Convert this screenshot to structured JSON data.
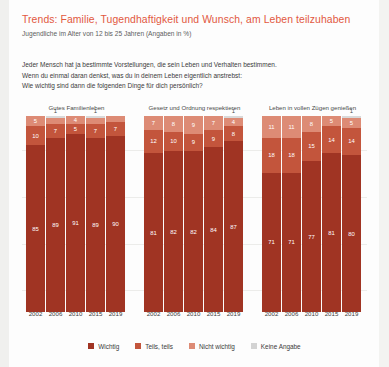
{
  "header": {
    "title": "Trends: Familie, Tugendhaftigkeit und Wunsch, am Leben teilzuhaben",
    "subtitle": "Jugendliche im Alter von 12 bis 25 Jahren (Angaben in %)",
    "title_color": "#e2583f"
  },
  "question": {
    "line1": "Jeder Mensch hat ja bestimmte Vorstellungen, die sein Leben und Verhalten bestimmen.",
    "line2": "Wenn du einmal daran denkst, was du in deinem Leben eigentlich anstrebst:",
    "line3": "Wie wichtig sind dann die folgenden Dinge für dich persönlich?"
  },
  "legend": {
    "items": [
      {
        "label": "Wichtig",
        "color": "#a03423"
      },
      {
        "label": "Teils, teils",
        "color": "#c3553c"
      },
      {
        "label": "Nicht wichtig",
        "color": "#dd8b75"
      },
      {
        "label": "Keine Angabe",
        "color": "#d3d3d3"
      }
    ]
  },
  "chart_data": {
    "type": "bar",
    "subtype": "stacked-100-grouped",
    "title": "Trends: Familie, Tugendhaftigkeit und Wunsch, am Leben teilzuhaben",
    "subtitle": "Jugendliche im Alter von 12 bis 25 Jahren (Angaben in %)",
    "xlabel": "",
    "ylabel": "",
    "ylim": [
      0,
      100
    ],
    "grid": true,
    "legend_position": "bottom",
    "categories": [
      "2002",
      "2006",
      "2010",
      "2015",
      "2019"
    ],
    "series": [
      {
        "name": "Wichtig",
        "color": "#a03423"
      },
      {
        "name": "Teils, teils",
        "color": "#c3553c"
      },
      {
        "name": "Nicht wichtig",
        "color": "#dd8b75"
      },
      {
        "name": "Keine Angabe",
        "color": "#d3d3d3"
      }
    ],
    "groups": [
      {
        "title": "Gutes Familienleben",
        "bars": [
          {
            "year": "2002",
            "wichtig": 85,
            "teils": 10,
            "nicht": 5,
            "keine": 0
          },
          {
            "year": "2006",
            "wichtig": 89,
            "teils": 7,
            "nicht": 3,
            "keine": 1
          },
          {
            "year": "2010",
            "wichtig": 91,
            "teils": 5,
            "nicht": 4,
            "keine": 0
          },
          {
            "year": "2015",
            "wichtig": 89,
            "teils": 7,
            "nicht": 3,
            "keine": 1
          },
          {
            "year": "2019",
            "wichtig": 90,
            "teils": 7,
            "nicht": 3,
            "keine": 0
          }
        ]
      },
      {
        "title": "Gesetz und Ordnung respektieren",
        "bars": [
          {
            "year": "2002",
            "wichtig": 81,
            "teils": 12,
            "nicht": 7,
            "keine": 0
          },
          {
            "year": "2006",
            "wichtig": 82,
            "teils": 10,
            "nicht": 8,
            "keine": 0
          },
          {
            "year": "2010",
            "wichtig": 82,
            "teils": 9,
            "nicht": 9,
            "keine": 0
          },
          {
            "year": "2015",
            "wichtig": 84,
            "teils": 9,
            "nicht": 7,
            "keine": 0
          },
          {
            "year": "2019",
            "wichtig": 87,
            "teils": 8,
            "nicht": 4,
            "keine": 1
          }
        ]
      },
      {
        "title": "Leben in vollen Zügen genießen",
        "bars": [
          {
            "year": "2002",
            "wichtig": 71,
            "teils": 18,
            "nicht": 11,
            "keine": 0
          },
          {
            "year": "2006",
            "wichtig": 71,
            "teils": 18,
            "nicht": 11,
            "keine": 0
          },
          {
            "year": "2010",
            "wichtig": 77,
            "teils": 15,
            "nicht": 8,
            "keine": 0
          },
          {
            "year": "2015",
            "wichtig": 81,
            "teils": 14,
            "nicht": 5,
            "keine": 0
          },
          {
            "year": "2019",
            "wichtig": 80,
            "teils": 14,
            "nicht": 5,
            "keine": 1
          }
        ]
      }
    ]
  }
}
